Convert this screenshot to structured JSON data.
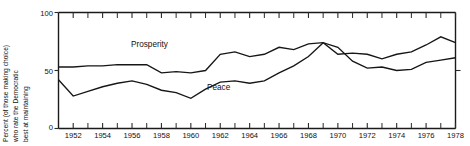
{
  "axis": {
    "y_label_lines": [
      "Percent (of those making choice)",
      "who rate the Democratic",
      "best at maintaining"
    ],
    "y_ticks": [
      "100",
      "50",
      "0"
    ],
    "x_ticks": [
      "1952",
      "1954",
      "1956",
      "1958",
      "1960",
      "1962",
      "1964",
      "1966",
      "1968",
      "1970",
      "1972",
      "1974",
      "1976",
      "1978"
    ]
  },
  "series_labels": {
    "prosperity": "Prosperity",
    "peace": "Peace"
  },
  "chart_data": {
    "type": "line",
    "title": "",
    "xlabel": "",
    "ylabel": "Percent (of those making choice) who rate the Democratic best at maintaining",
    "xlim": [
      1951,
      1978
    ],
    "ylim": [
      0,
      100
    ],
    "grid": false,
    "legend": "inline-annotations",
    "x_tick_interval": 2,
    "x_minor_tick_interval": 1,
    "y_tick_values": [
      0,
      50,
      100
    ],
    "annotations": [
      {
        "text": "Prosperity",
        "x": 1957.0,
        "y": 72
      },
      {
        "text": "Peace",
        "x": 1962.0,
        "y": 38
      }
    ],
    "x": [
      1951,
      1952,
      1953,
      1954,
      1955,
      1956,
      1957,
      1958,
      1959,
      1960,
      1961,
      1962,
      1963,
      1964,
      1965,
      1966,
      1967,
      1968,
      1969,
      1970,
      1971,
      1972,
      1973,
      1974,
      1975,
      1976,
      1977,
      1978
    ],
    "series": [
      {
        "name": "Prosperity",
        "values": [
          53,
          53,
          54,
          54,
          55,
          55,
          55,
          48,
          49,
          48,
          50,
          64,
          66,
          62,
          64,
          70,
          68,
          73,
          74,
          64,
          65,
          64,
          60,
          64,
          66,
          72,
          79,
          74
        ]
      },
      {
        "name": "Peace",
        "values": [
          42,
          28,
          32,
          36,
          39,
          41,
          38,
          33,
          31,
          26,
          34,
          40,
          41,
          39,
          41,
          48,
          54,
          62,
          74,
          70,
          58,
          52,
          53,
          50,
          51,
          57,
          59,
          61
        ]
      }
    ]
  }
}
